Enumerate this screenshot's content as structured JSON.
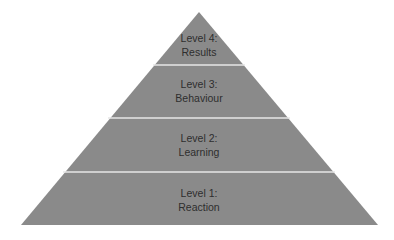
{
  "diagram": {
    "type": "pyramid",
    "fill_color": "#8a8a8a",
    "divider_color": "#e6e6e6",
    "levels": [
      {
        "title": "Level 4:",
        "subtitle": "Results"
      },
      {
        "title": "Level 3:",
        "subtitle": "Behaviour"
      },
      {
        "title": "Level 2:",
        "subtitle": "Learning"
      },
      {
        "title": "Level 1:",
        "subtitle": "Reaction"
      }
    ]
  }
}
